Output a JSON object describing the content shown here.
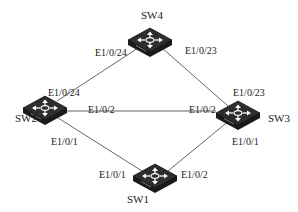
{
  "diagram": {
    "title": "",
    "nodes": [
      {
        "id": "SW4",
        "label": "SW4",
        "x": 150,
        "y": 40,
        "label_x": 152,
        "label_y": 19
      },
      {
        "id": "SW2",
        "label": "SW2",
        "x": 45,
        "y": 108,
        "label_x": 26,
        "label_y": 122
      },
      {
        "id": "SW3",
        "label": "SW3",
        "x": 238,
        "y": 113,
        "label_x": 279,
        "label_y": 122
      },
      {
        "id": "SW1",
        "label": "SW1",
        "x": 155,
        "y": 176,
        "label_x": 138,
        "label_y": 203
      }
    ],
    "links": [
      {
        "from": "SW4",
        "to": "SW2",
        "from_port": "E1/0/24",
        "to_port": "E1/0/24"
      },
      {
        "from": "SW4",
        "to": "SW3",
        "from_port": "E1/0/23",
        "to_port": "E1/0/23"
      },
      {
        "from": "SW2",
        "to": "SW3",
        "from_port": "E1/0/2",
        "to_port": "E1/0/2"
      },
      {
        "from": "SW2",
        "to": "SW1",
        "from_port": "E1/0/1",
        "to_port": "E1/0/1"
      },
      {
        "from": "SW3",
        "to": "SW1",
        "from_port": "E1/0/1",
        "to_port": "E1/0/2"
      }
    ],
    "port_labels": [
      {
        "text": "E1/0/24",
        "x": 95,
        "y": 56
      },
      {
        "text": "E1/0/23",
        "x": 185,
        "y": 54
      },
      {
        "text": "E1/0/24",
        "x": 48,
        "y": 96
      },
      {
        "text": "E1/0/23",
        "x": 233,
        "y": 96
      },
      {
        "text": "E1/0/2",
        "x": 88,
        "y": 113
      },
      {
        "text": "E1/0/2",
        "x": 189,
        "y": 113
      },
      {
        "text": "E1/0/1",
        "x": 51,
        "y": 145
      },
      {
        "text": "E1/0/1",
        "x": 232,
        "y": 145
      },
      {
        "text": "E1/0/1",
        "x": 99,
        "y": 178
      },
      {
        "text": "E1/0/2",
        "x": 181,
        "y": 178
      }
    ],
    "colors": {
      "switch_body": "#1a1a1a",
      "switch_top": "#3a3a3a",
      "arrows": "#ffffff",
      "link": "#555555",
      "text": "#222222"
    }
  }
}
